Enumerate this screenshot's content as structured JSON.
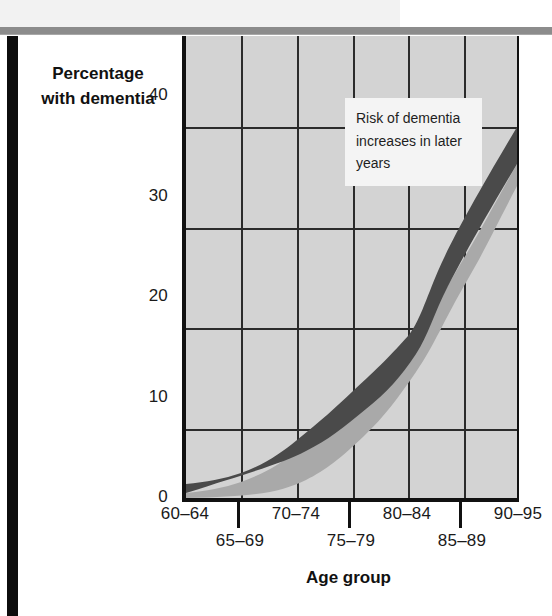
{
  "figure": {
    "left_bar": true,
    "accent_dark": "#4a4a4a",
    "accent_shadow": "#a9a9a9",
    "plot_background": "#d3d3d3",
    "grid_color": "#2b2b2b"
  },
  "annotation": {
    "text": "Risk of dementia increases in later years"
  },
  "chart_data": {
    "type": "area",
    "title": "",
    "subtitle": "",
    "xlabel": "Age group",
    "ylabel": "Percentage with dementia",
    "categories": [
      "60–64",
      "65–69",
      "70–74",
      "75–79",
      "80–84",
      "85–89",
      "90–95"
    ],
    "xtick_labels_upper": [
      "60–64",
      "70–74",
      "80–84",
      "90–95"
    ],
    "xtick_labels_lower": [
      "65–69",
      "75–79",
      "85–89"
    ],
    "ytick_labels": [
      "0",
      "10",
      "20",
      "30",
      "40"
    ],
    "yticks": [
      0,
      10,
      20,
      30,
      40
    ],
    "ylim": [
      0,
      46
    ],
    "grid": true,
    "legend_position": "none",
    "annotations": [
      {
        "text": "Risk of dementia increases in later years",
        "x_category": "80–84",
        "y_value": 42
      }
    ],
    "series": [
      {
        "name": "Upper estimate",
        "values": [
          1.5,
          2.3,
          4.2,
          6.8,
          10.5,
          20.5,
          40.0
        ]
      },
      {
        "name": "Lower estimate",
        "values": [
          0.2,
          0.8,
          2.2,
          4.6,
          8.5,
          17.0,
          34.0
        ]
      }
    ]
  }
}
